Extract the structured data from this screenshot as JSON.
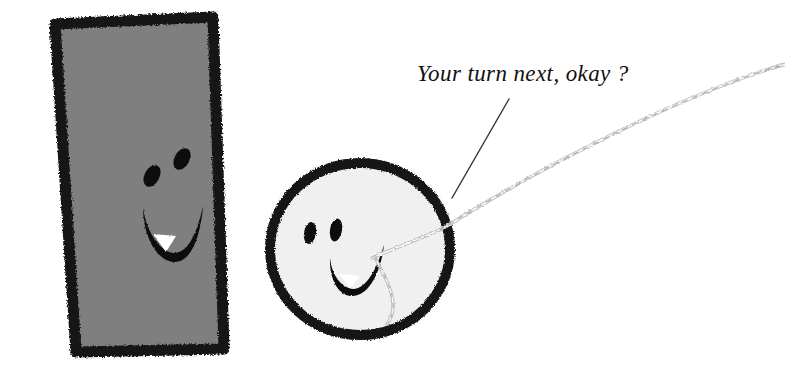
{
  "scene": {
    "width": 785,
    "height": 371,
    "background_color": "#ffffff",
    "title": "Hand-drawn rectangle and circle characters with thread"
  },
  "caption": {
    "text": "Your turn next, okay ?",
    "style": "italic-serif",
    "color": "#111111"
  },
  "characters": {
    "rectangle": {
      "name": "gray rectangle face",
      "fill_color": "#7f7f7f",
      "outline_color": "#141414",
      "mouth_tooth_color": "#ffffff",
      "expression": "smiling"
    },
    "circle": {
      "name": "white circle face",
      "fill_color": "#f0f0f0",
      "outline_color": "#141414",
      "mouth_tooth_color": "#ffffff",
      "expression": "smiling"
    }
  },
  "thread": {
    "name": "braided silver cord",
    "color": "#d6d6d6",
    "highlight_color": "#fafafa",
    "shade_color": "#9a9a9a"
  },
  "leader_line": {
    "name": "caption pointer line",
    "color": "#3a3a3a"
  }
}
